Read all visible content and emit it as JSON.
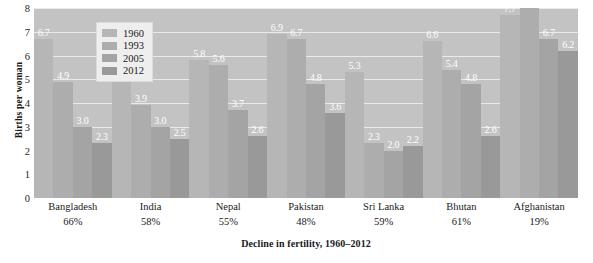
{
  "chart_data": {
    "type": "bar",
    "title": "",
    "xlabel": "Decline in fertility, 1960–2012",
    "ylabel": "Births per woman",
    "ylim": [
      0,
      8
    ],
    "yticks": [
      8,
      7,
      6,
      5,
      4,
      3,
      2,
      1,
      0
    ],
    "grid": true,
    "legend_position": "top-left",
    "categories": [
      "Bangladesh",
      "India",
      "Nepal",
      "Pakistan",
      "Sri Lanka",
      "Bhutan",
      "Afghanistan"
    ],
    "category_sublabels": [
      "66%",
      "58%",
      "55%",
      "48%",
      "59%",
      "61%",
      "19%"
    ],
    "series": [
      {
        "name": "1960",
        "color": "#b6b6b6",
        "values": [
          6.7,
          5.9,
          5.8,
          6.9,
          5.3,
          6.6,
          7.7
        ]
      },
      {
        "name": "1993",
        "color": "#adadad",
        "values": [
          4.9,
          3.9,
          5.6,
          6.7,
          2.3,
          5.4,
          8.0
        ]
      },
      {
        "name": "2005",
        "color": "#a4a4a4",
        "values": [
          3.0,
          3.0,
          3.7,
          4.8,
          2.0,
          4.8,
          6.7
        ]
      },
      {
        "name": "2012",
        "color": "#999999",
        "values": [
          2.3,
          2.5,
          2.6,
          3.6,
          2.2,
          2.6,
          6.2
        ]
      }
    ],
    "value_labels": [
      [
        "6.7",
        "4.9",
        "3.0",
        "2.3"
      ],
      [
        "5.9",
        "3.9",
        "3.0",
        "2.5"
      ],
      [
        "5.8",
        "5.6",
        "3.7",
        "2.6"
      ],
      [
        "6.9",
        "6.7",
        "4.8",
        "3.6"
      ],
      [
        "5.3",
        "2.3",
        "2.0",
        "2.2"
      ],
      [
        "6.6",
        "5.4",
        "4.8",
        "2.6"
      ],
      [
        "7.7",
        "8.0",
        "6.7",
        "6.2"
      ]
    ],
    "plot_background": "#c3c3c3",
    "gridline_color": "#eaeaea",
    "value_label_color": "#ffffff"
  }
}
